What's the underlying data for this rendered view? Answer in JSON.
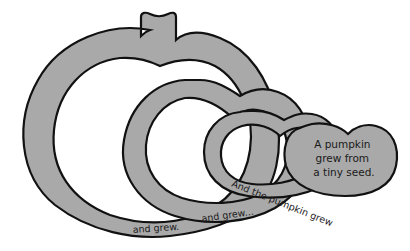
{
  "diagram": {
    "fill_color": "#a9a9a9",
    "outline_color": "#111111",
    "labels": {
      "seed": [
        "A pumpkin",
        "grew from",
        "a tiny seed."
      ],
      "small_ring": "And the pumpkin grew",
      "medium_ring": "and grew...",
      "large_ring": "and grew."
    }
  }
}
